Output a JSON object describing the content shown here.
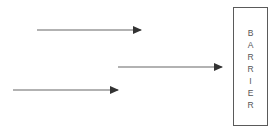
{
  "diagram": {
    "barrier": {
      "label": "BARRIER",
      "letters": [
        "B",
        "A",
        "R",
        "R",
        "I",
        "E",
        "R"
      ]
    },
    "arrows": [
      {
        "x1": 37,
        "y1": 30,
        "x2": 141,
        "y2": 30
      },
      {
        "x1": 118,
        "y1": 67,
        "x2": 222,
        "y2": 67
      },
      {
        "x1": 13,
        "y1": 90,
        "x2": 118,
        "y2": 90
      }
    ],
    "colors": {
      "stroke": "#555555",
      "arrowhead": "#333333",
      "text": "#555555"
    }
  }
}
